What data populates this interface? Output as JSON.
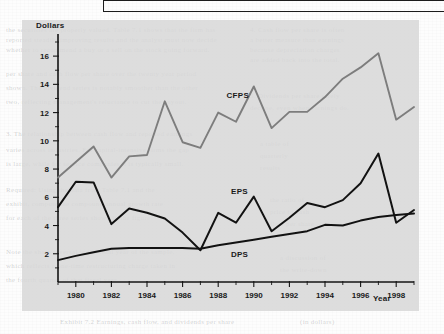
{
  "page": {
    "ghost_lines": [
      {
        "x": 6,
        "y": 26,
        "text": "the securities are properly valued. Table 7.1 shows that the firm has"
      },
      {
        "x": 6,
        "y": 36,
        "text": "reported steadily improving results and the analyst must now decide"
      },
      {
        "x": 6,
        "y": 46,
        "text": "whether to recommend a buy or a sell on the stock going forward."
      },
      {
        "x": 250,
        "y": 26,
        "text": "4. Cash flow per share is often"
      },
      {
        "x": 250,
        "y": 36,
        "text": "a better measure than earnings"
      },
      {
        "x": 250,
        "y": 46,
        "text": "because depreciation charges"
      },
      {
        "x": 250,
        "y": 56,
        "text": "are added back into the total."
      },
      {
        "x": 6,
        "y": 70,
        "text": "per share and cash flow per share over the twenty year period"
      },
      {
        "x": 6,
        "y": 84,
        "text": "shown. The dividend series is notably smoother than the other"
      },
      {
        "x": 6,
        "y": 98,
        "text": "two, reflecting management's reluctance to cut the payout."
      },
      {
        "x": 250,
        "y": 92,
        "text": "5. Dividends per share rarely"
      },
      {
        "x": 250,
        "y": 104,
        "text": "decline, even when earnings do."
      },
      {
        "x": 6,
        "y": 130,
        "text": "3. The relationship between cash flow and reported earnings"
      },
      {
        "x": 6,
        "y": 146,
        "text": "varies across industries. For capital-intensive firms the gap"
      },
      {
        "x": 6,
        "y": 160,
        "text": "is large, while for service companies it is typically small."
      },
      {
        "x": 260,
        "y": 140,
        "text": "a table of"
      },
      {
        "x": 260,
        "y": 152,
        "text": "quarterly"
      },
      {
        "x": 260,
        "y": 164,
        "text": "results"
      },
      {
        "x": 6,
        "y": 186,
        "text": "Required: Using the data from Table 7.1 and the"
      },
      {
        "x": 6,
        "y": 200,
        "text": "exhibit, compute the compound annual growth rate"
      },
      {
        "x": 6,
        "y": 214,
        "text": "for each of the three series shown in the figure."
      },
      {
        "x": 270,
        "y": 196,
        "text": "the ratio of"
      },
      {
        "x": 270,
        "y": 208,
        "text": "price to cash"
      },
      {
        "x": 270,
        "y": 220,
        "text": "flow per share"
      },
      {
        "x": 6,
        "y": 248,
        "text": "Note the sharp reversal in the final year of the sample,"
      },
      {
        "x": 6,
        "y": 262,
        "text": "which reflects a one-time restructuring charge taken in"
      },
      {
        "x": 6,
        "y": 276,
        "text": "the fourth quarter of that fiscal year."
      },
      {
        "x": 280,
        "y": 254,
        "text": "a discussion of"
      },
      {
        "x": 280,
        "y": 266,
        "text": "the write-down"
      },
      {
        "x": 60,
        "y": 318,
        "text": "Exhibit 7.2   Earnings, cash flow, and dividends per share"
      },
      {
        "x": 300,
        "y": 318,
        "text": "(in dollars)"
      }
    ]
  },
  "chart_data": {
    "type": "line",
    "title": "",
    "xlabel": "Year",
    "ylabel": "Dollars",
    "xlim": [
      1979,
      1999
    ],
    "ylim": [
      0,
      17
    ],
    "ytick_labels": [
      "2",
      "4",
      "6",
      "8",
      "10",
      "12",
      "14",
      "16"
    ],
    "ytick_values": [
      2,
      4,
      6,
      8,
      10,
      12,
      14,
      16
    ],
    "xtick_labels": [
      "1980",
      "1982",
      "1984",
      "1986",
      "1988",
      "1990",
      "1992",
      "1994",
      "1996",
      "1998"
    ],
    "xtick_values": [
      1980,
      1982,
      1984,
      1986,
      1988,
      1990,
      1992,
      1994,
      1996,
      1998
    ],
    "grid": false,
    "legend_position": "inline-labels",
    "x": [
      1979,
      1980,
      1981,
      1982,
      1983,
      1984,
      1985,
      1986,
      1987,
      1988,
      1989,
      1990,
      1991,
      1992,
      1993,
      1994,
      1995,
      1996,
      1997,
      1998,
      1999
    ],
    "series": [
      {
        "name": "CFPS",
        "label": "CFPS",
        "color": "#7d7d7d",
        "label_x": 1989.1,
        "label_y": 13.05,
        "values": [
          7.4,
          8.5,
          9.6,
          7.4,
          8.9,
          9.0,
          12.8,
          9.9,
          9.5,
          12.0,
          11.35,
          13.85,
          10.9,
          12.05,
          12.05,
          13.1,
          14.4,
          15.2,
          16.2,
          11.5,
          12.4
        ]
      },
      {
        "name": "EPS",
        "label": "EPS",
        "color": "#121212",
        "label_x": 1989.2,
        "label_y": 6.25,
        "values": [
          5.3,
          7.1,
          7.05,
          4.1,
          5.2,
          4.9,
          4.5,
          3.5,
          2.25,
          4.9,
          4.2,
          6.05,
          3.6,
          4.55,
          5.6,
          5.3,
          5.8,
          7.0,
          9.1,
          4.2,
          5.1
        ]
      },
      {
        "name": "DPS",
        "label": "DPS",
        "color": "#121212",
        "label_x": 1989.2,
        "label_y": 1.75,
        "values": [
          1.55,
          1.85,
          2.1,
          2.35,
          2.4,
          2.4,
          2.4,
          2.4,
          2.35,
          2.6,
          2.8,
          3.0,
          3.2,
          3.4,
          3.6,
          4.05,
          4.0,
          4.35,
          4.6,
          4.75,
          4.85
        ]
      }
    ]
  }
}
